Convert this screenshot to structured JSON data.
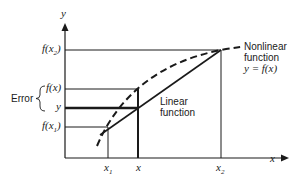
{
  "axes": {
    "y_label": "y",
    "x_label": "x"
  },
  "y_ticks": {
    "f_x2": {
      "fn": "f(x",
      "sub": "2",
      "close": ")"
    },
    "f_x": "f(x)",
    "y": "y",
    "f_x1": {
      "fn": "f(x",
      "sub": "1",
      "close": ")"
    }
  },
  "x_ticks": {
    "x1": {
      "base": "x",
      "sub": "1"
    },
    "x": "x",
    "x2": {
      "base": "x",
      "sub": "2"
    }
  },
  "error_label": "Error",
  "nonlinear": {
    "line1": "Nonlinear",
    "line2": "function",
    "line3": "y = f(x)"
  },
  "linear": {
    "line1": "Linear",
    "line2": "function"
  },
  "colors": {
    "ink": "#1a1a1a",
    "background": "#ffffff"
  }
}
